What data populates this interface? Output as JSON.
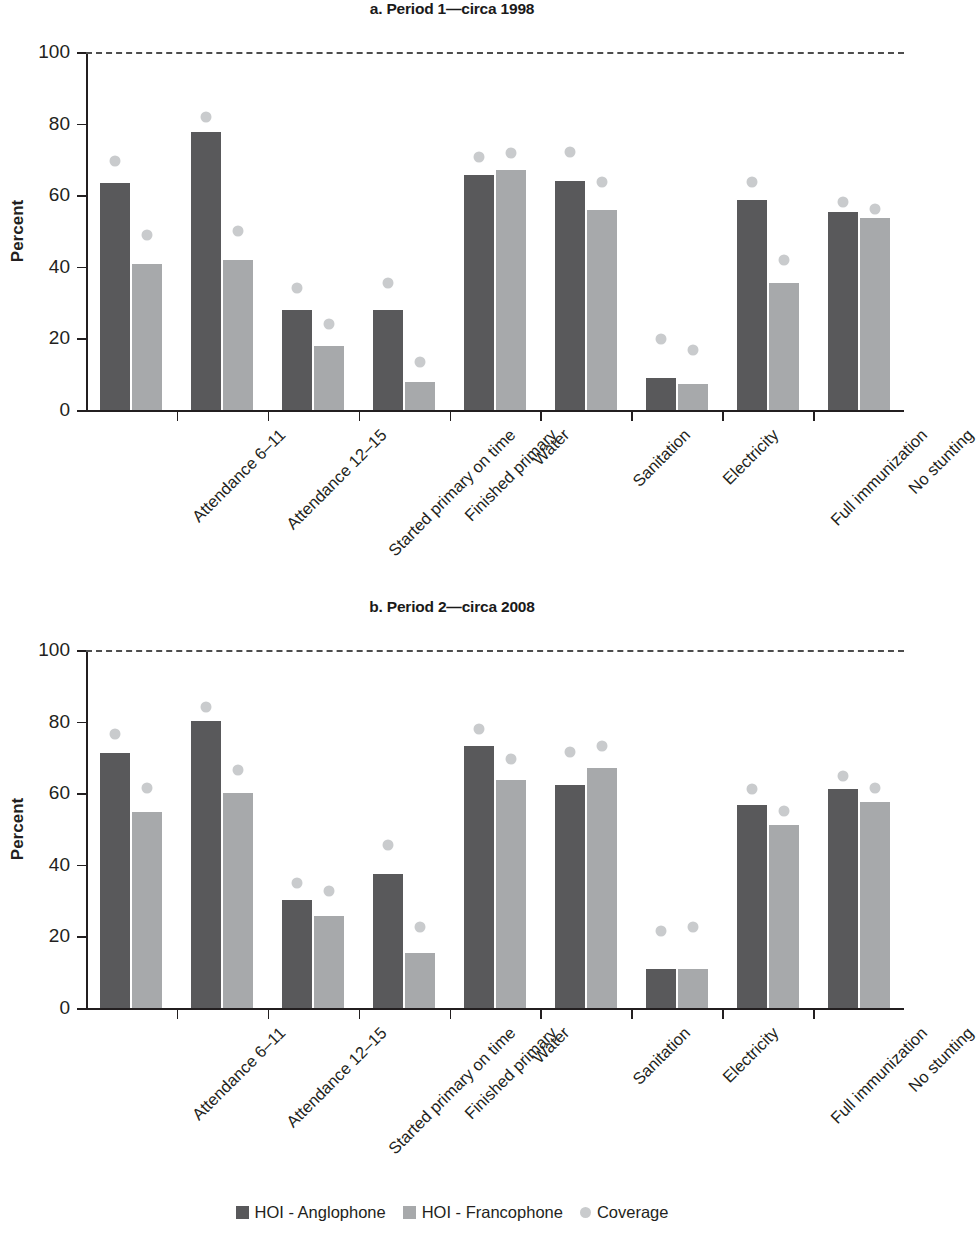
{
  "axis": {
    "ylabel": "Percent",
    "yticks": [
      0,
      20,
      40,
      60,
      80,
      100
    ],
    "ymin": 0,
    "ymax": 100
  },
  "categories": [
    "Attendance 6–11",
    "Attendance 12–15",
    "Started primary on time",
    "Finished primary",
    "Water",
    "Sanitation",
    "Electricity",
    "Full immunization",
    "No stunting"
  ],
  "legend": {
    "items": [
      {
        "label": "HOI - Anglophone",
        "color": "#59595b",
        "marker": "square"
      },
      {
        "label": "HOI - Francophone",
        "color": "#a7a9ab",
        "marker": "square"
      },
      {
        "label": "Coverage",
        "color": "#c9cbcd",
        "marker": "circle"
      }
    ]
  },
  "panels": [
    {
      "id": "a",
      "title": "a. Period 1—circa 1998"
    },
    {
      "id": "b",
      "title": "b. Period 2—circa 2008"
    }
  ],
  "chart_data": [
    {
      "type": "bar",
      "title": "a. Period 1—circa 1998",
      "xlabel": "",
      "ylabel": "Percent",
      "ylim": [
        0,
        100
      ],
      "yticks": [
        0,
        20,
        40,
        60,
        80,
        100
      ],
      "grid": false,
      "reference_line": 100,
      "legend_position": "bottom",
      "categories": [
        "Attendance 6–11",
        "Attendance 12–15",
        "Started primary on time",
        "Finished primary",
        "Water",
        "Sanitation",
        "Electricity",
        "Full immunization",
        "No stunting"
      ],
      "series": [
        {
          "name": "HOI - Anglophone",
          "type": "bar",
          "color": "#59595b",
          "values": [
            63.3,
            77.6,
            27.8,
            28.0,
            65.6,
            64.0,
            9.0,
            58.8,
            55.4
          ]
        },
        {
          "name": "HOI - Francophone",
          "type": "bar",
          "color": "#a7a9ab",
          "values": [
            40.8,
            42.0,
            17.9,
            7.9,
            67.0,
            56.0,
            7.3,
            35.4,
            53.5
          ]
        },
        {
          "name": "Coverage - Anglophone",
          "type": "scatter",
          "color": "#c9cbcd",
          "values": [
            69.5,
            81.8,
            34.0,
            35.5,
            70.7,
            72.0,
            19.7,
            63.8,
            58.0
          ]
        },
        {
          "name": "Coverage - Francophone",
          "type": "scatter",
          "color": "#c9cbcd",
          "values": [
            48.8,
            50.1,
            24.0,
            13.4,
            71.7,
            63.7,
            16.8,
            41.9,
            56.2
          ]
        }
      ]
    },
    {
      "type": "bar",
      "title": "b. Period 2—circa 2008",
      "xlabel": "",
      "ylabel": "Percent",
      "ylim": [
        0,
        100
      ],
      "yticks": [
        0,
        20,
        40,
        60,
        80,
        100
      ],
      "grid": false,
      "reference_line": 100,
      "legend_position": "bottom",
      "categories": [
        "Attendance 6–11",
        "Attendance 12–15",
        "Started primary on time",
        "Finished primary",
        "Water",
        "Sanitation",
        "Electricity",
        "Full immunization",
        "No stunting"
      ],
      "series": [
        {
          "name": "HOI - Anglophone",
          "type": "bar",
          "color": "#59595b",
          "values": [
            71.3,
            80.3,
            30.2,
            37.5,
            73.2,
            62.4,
            11.0,
            56.7,
            61.2
          ]
        },
        {
          "name": "HOI - Francophone",
          "type": "bar",
          "color": "#a7a9ab",
          "values": [
            54.7,
            60.0,
            25.8,
            15.4,
            63.6,
            67.0,
            11.0,
            51.0,
            57.5
          ]
        },
        {
          "name": "Coverage - Anglophone",
          "type": "scatter",
          "color": "#c9cbcd",
          "values": [
            76.6,
            84.2,
            34.8,
            45.5,
            78.0,
            71.5,
            21.5,
            61.3,
            64.8
          ]
        },
        {
          "name": "Coverage - Francophone",
          "type": "scatter",
          "color": "#c9cbcd",
          "values": [
            61.4,
            66.4,
            32.6,
            22.5,
            69.5,
            73.3,
            22.7,
            55.0,
            61.4
          ]
        }
      ]
    }
  ]
}
